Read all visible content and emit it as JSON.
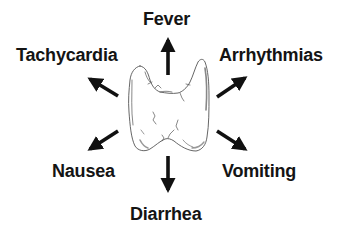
{
  "diagram": {
    "center": {
      "name": "thyroid gland",
      "fill": "#ffffff",
      "stroke": "#555555"
    },
    "arrow_color": "#111111",
    "symptoms": [
      {
        "id": "fever",
        "label": "Fever",
        "direction": "up"
      },
      {
        "id": "tachycardia",
        "label": "Tachycardia",
        "direction": "up-left"
      },
      {
        "id": "arrhythmias",
        "label": "Arrhythmias",
        "direction": "up-right"
      },
      {
        "id": "nausea",
        "label": "Nausea",
        "direction": "down-left"
      },
      {
        "id": "vomiting",
        "label": "Vomiting",
        "direction": "down-right"
      },
      {
        "id": "diarrhea",
        "label": "Diarrhea",
        "direction": "down"
      }
    ]
  }
}
